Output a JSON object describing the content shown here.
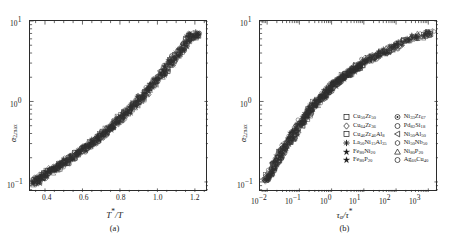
{
  "figure": {
    "panels": [
      {
        "id": "a",
        "caption": "(a)",
        "xlabel_html": "T*/T",
        "ylabel_html": "α2,max"
      },
      {
        "id": "b",
        "caption": "(b)",
        "xlabel_html": "τα/τ*",
        "ylabel_html": "α2,max"
      }
    ],
    "legend": {
      "entries": [
        {
          "marker": "square-open",
          "label": "Cu50Zr50",
          "col": 0
        },
        {
          "marker": "circled-dot",
          "label": "Ni33Zr67",
          "col": 1
        },
        {
          "marker": "diamond-open",
          "label": "Cu64Zr36",
          "col": 0
        },
        {
          "marker": "circle-open",
          "label": "Pd82Si18",
          "col": 1
        },
        {
          "marker": "square-open-2",
          "label": "Cu46Zr46Al8",
          "col": 0
        },
        {
          "marker": "triangle-left-open",
          "label": "Ni50Al50",
          "col": 1
        },
        {
          "marker": "asterisk-filled",
          "label": "La50Ni15Al35",
          "col": 0
        },
        {
          "marker": "hexagon-open",
          "label": "Ni50Nb50",
          "col": 1
        },
        {
          "marker": "star-filled",
          "label": "Fe80Ni20",
          "col": 0
        },
        {
          "marker": "triangle-up-open",
          "label": "Ni80P20",
          "col": 1
        },
        {
          "marker": "star-filled-2",
          "label": "Fe80P20",
          "col": 0
        },
        {
          "marker": "circle-open-2",
          "label": "Ag60Cu40",
          "col": 1
        }
      ]
    }
  },
  "chart_data": [
    {
      "type": "scatter",
      "panel": "a",
      "title": "",
      "xlabel": "T*/T",
      "ylabel": "alpha_2,max",
      "xscale": "linear",
      "yscale": "log",
      "xlim": [
        0.32,
        1.27
      ],
      "ylim": [
        0.075,
        10.0
      ],
      "xticks": [
        0.4,
        0.6,
        0.8,
        1.0,
        1.2
      ],
      "xticklabels": [
        "0.4",
        "0.6",
        "0.8",
        "1.0",
        "1.2"
      ],
      "yticks": [
        0.1,
        1.0,
        10.0
      ],
      "yticklabels": [
        "10-1",
        "100",
        "101"
      ],
      "grid": false,
      "legend_position": "none",
      "x": [
        0.34,
        0.345,
        0.35,
        0.352,
        0.358,
        0.36,
        0.362,
        0.368,
        0.37,
        0.375,
        0.38,
        0.382,
        0.388,
        0.39,
        0.395,
        0.4,
        0.405,
        0.41,
        0.415,
        0.42,
        0.425,
        0.43,
        0.435,
        0.44,
        0.445,
        0.45,
        0.455,
        0.46,
        0.465,
        0.47,
        0.475,
        0.48,
        0.485,
        0.49,
        0.495,
        0.5,
        0.505,
        0.51,
        0.515,
        0.52,
        0.525,
        0.53,
        0.535,
        0.54,
        0.545,
        0.55,
        0.555,
        0.56,
        0.565,
        0.57,
        0.575,
        0.58,
        0.585,
        0.59,
        0.595,
        0.6,
        0.605,
        0.61,
        0.615,
        0.62,
        0.625,
        0.63,
        0.635,
        0.64,
        0.645,
        0.65,
        0.655,
        0.66,
        0.665,
        0.67,
        0.675,
        0.68,
        0.685,
        0.69,
        0.695,
        0.7,
        0.705,
        0.71,
        0.715,
        0.72,
        0.725,
        0.73,
        0.735,
        0.74,
        0.745,
        0.75,
        0.755,
        0.76,
        0.765,
        0.77,
        0.775,
        0.78,
        0.785,
        0.79,
        0.795,
        0.8,
        0.805,
        0.81,
        0.815,
        0.82,
        0.825,
        0.83,
        0.835,
        0.84,
        0.845,
        0.85,
        0.855,
        0.86,
        0.865,
        0.87,
        0.875,
        0.88,
        0.885,
        0.89,
        0.895,
        0.9,
        0.905,
        0.91,
        0.915,
        0.92,
        0.925,
        0.93,
        0.935,
        0.94,
        0.945,
        0.95,
        0.955,
        0.96,
        0.965,
        0.97,
        0.975,
        0.98,
        0.985,
        0.99,
        0.995,
        1.0,
        1.005,
        1.01,
        1.015,
        1.02,
        1.025,
        1.03,
        1.035,
        1.04,
        1.045,
        1.05,
        1.055,
        1.06,
        1.065,
        1.07,
        1.075,
        1.08,
        1.085,
        1.09,
        1.095,
        1.1,
        1.105,
        1.11,
        1.115,
        1.12,
        1.125,
        1.13,
        1.135,
        1.14,
        1.145,
        1.15,
        1.155,
        1.16,
        1.165,
        1.17,
        1.175,
        1.18,
        1.185,
        1.19,
        1.195,
        1.2,
        1.205,
        1.21,
        1.215,
        1.22,
        1.225,
        1.23,
        1.235,
        1.24
      ],
      "y": [
        0.098,
        0.1,
        0.101,
        0.103,
        0.104,
        0.106,
        0.107,
        0.109,
        0.11,
        0.112,
        0.114,
        0.115,
        0.117,
        0.119,
        0.121,
        0.123,
        0.125,
        0.127,
        0.129,
        0.131,
        0.133,
        0.135,
        0.138,
        0.14,
        0.142,
        0.145,
        0.147,
        0.15,
        0.152,
        0.155,
        0.158,
        0.16,
        0.163,
        0.166,
        0.169,
        0.172,
        0.175,
        0.178,
        0.181,
        0.185,
        0.188,
        0.191,
        0.195,
        0.199,
        0.202,
        0.206,
        0.21,
        0.214,
        0.218,
        0.222,
        0.227,
        0.231,
        0.236,
        0.24,
        0.245,
        0.25,
        0.255,
        0.26,
        0.265,
        0.271,
        0.276,
        0.282,
        0.288,
        0.294,
        0.3,
        0.306,
        0.313,
        0.319,
        0.326,
        0.333,
        0.34,
        0.348,
        0.355,
        0.363,
        0.371,
        0.379,
        0.388,
        0.396,
        0.405,
        0.414,
        0.424,
        0.433,
        0.443,
        0.453,
        0.464,
        0.475,
        0.486,
        0.497,
        0.509,
        0.521,
        0.534,
        0.547,
        0.56,
        0.574,
        0.588,
        0.603,
        0.618,
        0.633,
        0.65,
        0.666,
        0.684,
        0.702,
        0.72,
        0.739,
        0.759,
        0.78,
        0.801,
        0.823,
        0.846,
        0.869,
        0.894,
        0.919,
        0.945,
        0.972,
        1.0,
        1.029,
        1.059,
        1.09,
        1.122,
        1.155,
        1.19,
        1.225,
        1.262,
        1.3,
        1.34,
        1.381,
        1.423,
        1.467,
        1.513,
        1.56,
        1.609,
        1.66,
        1.712,
        1.767,
        1.823,
        1.882,
        1.943,
        2.006,
        2.072,
        2.14,
        2.211,
        2.284,
        2.361,
        2.44,
        2.523,
        2.609,
        2.698,
        2.791,
        2.888,
        2.989,
        3.094,
        3.203,
        3.317,
        3.435,
        3.559,
        3.688,
        3.822,
        3.962,
        4.108,
        4.261,
        4.42,
        4.586,
        4.759,
        4.94,
        5.129,
        5.326,
        5.532,
        5.747,
        5.971,
        6.205,
        6.45,
        6.706,
        6.5,
        6.3,
        6.1,
        6.4,
        6.6,
        6.8,
        6.9,
        7.0
      ],
      "n_points": 183,
      "description": "Dense scatter of alpha_2,max versus reduced inverse temperature T*/T for 12 metallic-glass-forming alloys; all data collapse onto a single increasing master curve spanning ~0.1 to ~7 on a log y-axis."
    },
    {
      "type": "scatter",
      "panel": "b",
      "title": "",
      "xlabel": "tau_alpha/tau*",
      "ylabel": "alpha_2,max",
      "xscale": "log",
      "yscale": "log",
      "xlim": [
        0.006,
        2000
      ],
      "ylim": [
        0.075,
        10.0
      ],
      "xticks": [
        0.01,
        0.1,
        1,
        10,
        100,
        1000
      ],
      "xticklabels": [
        "10-2",
        "10-1",
        "100",
        "101",
        "102",
        "103"
      ],
      "yticks": [
        0.1,
        1.0,
        10.0
      ],
      "yticklabels": [
        "10-1",
        "100",
        "101"
      ],
      "grid": false,
      "legend_position": "inside-lower-right",
      "x": [
        0.0085,
        0.009,
        0.0095,
        0.01,
        0.0105,
        0.011,
        0.0115,
        0.012,
        0.0126,
        0.0132,
        0.0138,
        0.0145,
        0.0152,
        0.016,
        0.0168,
        0.0176,
        0.0185,
        0.0194,
        0.0204,
        0.0214,
        0.0225,
        0.0236,
        0.0248,
        0.026,
        0.0273,
        0.0287,
        0.0301,
        0.0316,
        0.0332,
        0.0349,
        0.0366,
        0.0385,
        0.0404,
        0.0424,
        0.0446,
        0.0468,
        0.0492,
        0.0516,
        0.0542,
        0.0569,
        0.0598,
        0.0628,
        0.066,
        0.0693,
        0.0728,
        0.0764,
        0.0803,
        0.0843,
        0.0886,
        0.093,
        0.0977,
        0.103,
        0.108,
        0.113,
        0.119,
        0.125,
        0.131,
        0.138,
        0.145,
        0.152,
        0.16,
        0.168,
        0.176,
        0.185,
        0.194,
        0.204,
        0.214,
        0.225,
        0.236,
        0.248,
        0.261,
        0.274,
        0.288,
        0.302,
        0.317,
        0.333,
        0.35,
        0.368,
        0.386,
        0.406,
        0.426,
        0.448,
        0.47,
        0.494,
        0.519,
        0.545,
        0.572,
        0.601,
        0.631,
        0.663,
        0.696,
        0.731,
        0.768,
        0.807,
        0.847,
        0.89,
        0.935,
        0.982,
        1.03,
        1.08,
        1.14,
        1.2,
        1.26,
        1.32,
        1.39,
        1.46,
        1.53,
        1.61,
        1.69,
        1.77,
        1.86,
        1.96,
        2.06,
        2.16,
        2.27,
        2.38,
        2.5,
        2.63,
        2.76,
        2.9,
        3.05,
        3.2,
        3.36,
        3.53,
        3.71,
        3.9,
        4.09,
        4.3,
        4.52,
        4.75,
        4.99,
        5.24,
        5.5,
        5.78,
        6.07,
        6.38,
        6.7,
        7.04,
        7.39,
        7.77,
        8.16,
        8.57,
        9.0,
        9.46,
        10.4,
        11.5,
        12.7,
        14.0,
        15.4,
        17.0,
        18.8,
        20.7,
        22.9,
        25.2,
        27.8,
        30.7,
        33.9,
        37.4,
        41.2,
        45.5,
        50.2,
        55.4,
        61.1,
        67.4,
        74.4,
        82.1,
        90.6,
        100,
        116,
        134,
        156,
        181,
        210,
        243,
        282,
        327,
        379,
        440,
        510,
        592,
        687,
        797,
        925,
        1073,
        1245,
        1350,
        1420
      ],
      "y": [
        0.1,
        0.104,
        0.108,
        0.112,
        0.116,
        0.12,
        0.124,
        0.128,
        0.133,
        0.137,
        0.142,
        0.147,
        0.152,
        0.157,
        0.163,
        0.168,
        0.174,
        0.18,
        0.186,
        0.192,
        0.198,
        0.205,
        0.212,
        0.219,
        0.226,
        0.233,
        0.241,
        0.249,
        0.257,
        0.265,
        0.274,
        0.283,
        0.292,
        0.301,
        0.311,
        0.32,
        0.33,
        0.341,
        0.351,
        0.362,
        0.373,
        0.385,
        0.396,
        0.408,
        0.42,
        0.433,
        0.446,
        0.459,
        0.472,
        0.486,
        0.5,
        0.514,
        0.529,
        0.544,
        0.559,
        0.575,
        0.591,
        0.607,
        0.624,
        0.641,
        0.658,
        0.676,
        0.694,
        0.712,
        0.731,
        0.75,
        0.769,
        0.789,
        0.809,
        0.829,
        0.85,
        0.871,
        0.892,
        0.914,
        0.936,
        0.958,
        0.981,
        1.004,
        1.027,
        1.05,
        1.074,
        1.098,
        1.122,
        1.147,
        1.171,
        1.196,
        1.222,
        1.247,
        1.273,
        1.299,
        1.325,
        1.352,
        1.378,
        1.405,
        1.432,
        1.46,
        1.487,
        1.515,
        1.543,
        1.571,
        1.6,
        1.628,
        1.657,
        1.686,
        1.715,
        1.745,
        1.774,
        1.804,
        1.834,
        1.864,
        1.894,
        1.925,
        1.955,
        1.986,
        2.017,
        2.048,
        2.079,
        2.11,
        2.142,
        2.173,
        2.205,
        2.237,
        2.269,
        2.301,
        2.334,
        2.366,
        2.399,
        2.431,
        2.464,
        2.497,
        2.53,
        2.563,
        2.597,
        2.63,
        2.664,
        2.697,
        2.731,
        2.765,
        2.799,
        2.833,
        2.867,
        2.901,
        2.97,
        3.04,
        3.11,
        3.18,
        3.251,
        3.322,
        3.393,
        3.464,
        3.536,
        3.608,
        3.68,
        3.752,
        3.824,
        3.897,
        3.97,
        4.043,
        4.116,
        4.189,
        4.262,
        4.336,
        4.409,
        4.483,
        4.557,
        4.631,
        4.78,
        4.929,
        5.078,
        5.227,
        5.377,
        5.526,
        5.676,
        5.826,
        5.976,
        6.126,
        6.276,
        6.4,
        6.5,
        6.6,
        6.7,
        6.8,
        6.9,
        6.95,
        7.0
      ],
      "n_points": 185,
      "description": "Same alpha_2,max data replotted against reduced structural relaxation time tau_alpha/tau* on log-log axes, collapsing onto a single monotonic master curve from ~0.1 to ~7 over six decades of time."
    }
  ]
}
